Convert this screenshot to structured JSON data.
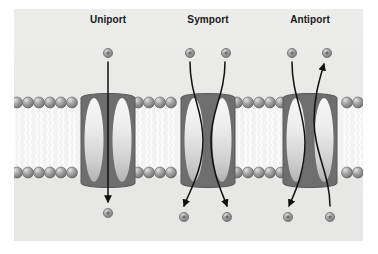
{
  "figure": {
    "background_color": "#ffffff",
    "panel_color": "#eaeae9",
    "panel": {
      "x": 14,
      "y": 9,
      "width": 349,
      "height": 232
    }
  },
  "labels": [
    {
      "text": "Uniport",
      "x": 108,
      "y": 14
    },
    {
      "text": "Symport",
      "x": 208,
      "y": 14
    },
    {
      "text": "Antiport",
      "x": 310,
      "y": 14
    }
  ],
  "membrane": {
    "top": 97,
    "bottom": 178,
    "head_color": "#8f8f8f",
    "head_highlight": "#d8d8d8",
    "head_outline": "#5f5f5f",
    "tail_color": "#ffffff",
    "interior_color": "#f4f4f4",
    "head_radius": 5.5,
    "head_spacing": 11,
    "left": 14,
    "right": 363
  },
  "proteins": [
    {
      "name": "uniport-protein",
      "center_x": 108,
      "half_width": 27,
      "lobe_fill_top": "#f2f2f2",
      "lobe_fill_bottom": "#b9b9b9",
      "outline_color": "#5a5a5a",
      "outline_width": 4.5,
      "top": 95,
      "bottom": 186
    },
    {
      "name": "symport-protein",
      "center_x": 208,
      "half_width": 27,
      "lobe_fill_top": "#f2f2f2",
      "lobe_fill_bottom": "#b9b9b9",
      "outline_color": "#5a5a5a",
      "outline_width": 4.5,
      "top": 95,
      "bottom": 186
    },
    {
      "name": "antiport-protein",
      "center_x": 310,
      "half_width": 27,
      "lobe_fill_top": "#f2f2f2",
      "lobe_fill_bottom": "#b9b9b9",
      "outline_color": "#5a5a5a",
      "outline_width": 4.5,
      "top": 95,
      "bottom": 186
    }
  ],
  "solutes": {
    "radius": 4.6,
    "fill": "#a0a0a0",
    "core": "#6a6a6a",
    "highlight": "#d6d6d6",
    "outline": "#6d6d6d",
    "items": [
      {
        "name": "uniport-solute-top",
        "x": 108,
        "y": 53
      },
      {
        "name": "uniport-solute-bottom",
        "x": 108,
        "y": 213
      },
      {
        "name": "symport-solute-top-left",
        "x": 190,
        "y": 53
      },
      {
        "name": "symport-solute-top-right",
        "x": 226,
        "y": 53
      },
      {
        "name": "symport-solute-bottom-left",
        "x": 184,
        "y": 217
      },
      {
        "name": "symport-solute-bottom-right",
        "x": 227,
        "y": 217
      },
      {
        "name": "antiport-solute-top-left",
        "x": 292,
        "y": 53
      },
      {
        "name": "antiport-solute-top-right",
        "x": 327,
        "y": 53
      },
      {
        "name": "antiport-solute-bottom-left",
        "x": 288,
        "y": 217
      },
      {
        "name": "antiport-solute-bottom-right",
        "x": 330,
        "y": 217
      }
    ]
  },
  "transport_arrows": {
    "color": "#101010",
    "stroke_width": 1.5,
    "items": [
      {
        "name": "uniport-arrow-inward",
        "direction": "inward",
        "path": "M 108 62 L 108 202"
      },
      {
        "name": "symport-arrow-left-inward",
        "direction": "inward",
        "path": "M 190 62 C 190 95, 203 110, 203 140 C 203 170, 190 190, 184 206"
      },
      {
        "name": "symport-arrow-right-inward",
        "direction": "inward",
        "path": "M 225 62 C 225 95, 211 110, 211 140 C 211 172, 222 192, 227 206"
      },
      {
        "name": "antiport-arrow-left-inward",
        "direction": "inward",
        "path": "M 292 62 C 292 96, 305 112, 305 142 C 305 172, 295 192, 289 206"
      },
      {
        "name": "antiport-arrow-right-outward",
        "direction": "outward",
        "path": "M 330 206 C 330 175, 314 152, 314 120 C 314 96, 320 78, 324 64"
      }
    ]
  }
}
